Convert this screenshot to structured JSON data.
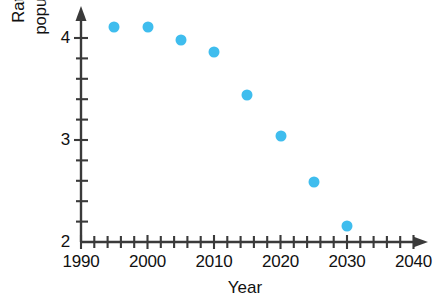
{
  "chart_data": {
    "type": "scatter",
    "title": "",
    "xlabel": "Year",
    "ylabel": "Ratio of working-age population to the elderly",
    "ylabel_lines": [
      "Ratio of working-age",
      "population to the elderly"
    ],
    "x": [
      1995,
      2000,
      2005,
      2010,
      2015,
      2020,
      2025,
      2030
    ],
    "values": [
      4.11,
      4.11,
      3.98,
      3.86,
      3.44,
      3.04,
      2.59,
      2.16
    ],
    "xlim": [
      1990,
      2040
    ],
    "ylim": [
      2,
      4.3
    ],
    "x_tick_labels": [
      "1990",
      "2000",
      "2010",
      "2020",
      "2030",
      "2040"
    ],
    "x_tick_values": [
      1990,
      2000,
      2010,
      2020,
      2030,
      2040
    ],
    "x_minor_tick_step": 2,
    "y_tick_labels": [
      "2",
      "3",
      "4"
    ],
    "y_tick_values": [
      2,
      3,
      4
    ],
    "y_minor_tick_step": 0.2,
    "grid": false,
    "legend": null,
    "marker_color": "#3fbdee",
    "axis_color": "#3a3a3a",
    "series_name": "Ratio of working-age population to the elderly"
  }
}
